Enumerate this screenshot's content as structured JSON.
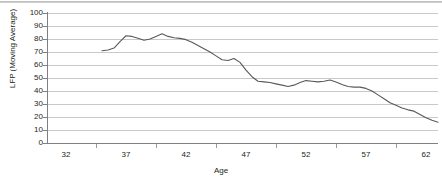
{
  "chart_data": {
    "type": "line",
    "title": "",
    "xlabel": "Age",
    "ylabel": "LFP (Moving Average)",
    "xlim": [
      30.5,
      63.0
    ],
    "ylim": [
      0,
      100
    ],
    "grid": true,
    "legend": false,
    "legend_position": "none",
    "x_tick_labels": [
      "32",
      "37",
      "42",
      "47",
      "52",
      "57",
      "62"
    ],
    "x_tick_values": [
      32,
      37,
      42,
      47,
      52,
      57,
      62
    ],
    "x_minor_tick_values": [
      34.5,
      39.5,
      44.5,
      49.5,
      54.5,
      59.5
    ],
    "y_tick_labels": [
      "0",
      "10",
      "20",
      "30",
      "40",
      "50",
      "60",
      "70",
      "80",
      "90",
      "100"
    ],
    "y_tick_values": [
      0,
      10,
      20,
      30,
      40,
      50,
      60,
      70,
      80,
      90,
      100
    ],
    "line_color": "#595959",
    "grid_color": "#c9c9c9",
    "axis_color": "#808080",
    "series": [
      {
        "name": "LFP (Moving Average)",
        "x": [
          35.0,
          35.5,
          36.0,
          36.5,
          37.0,
          37.5,
          38.0,
          38.5,
          39.0,
          39.5,
          40.0,
          40.5,
          41.0,
          41.5,
          42.0,
          42.5,
          43.0,
          43.5,
          44.0,
          44.5,
          45.0,
          45.5,
          46.0,
          46.5,
          47.0,
          47.5,
          48.0,
          48.5,
          49.0,
          49.5,
          50.0,
          50.5,
          51.0,
          51.5,
          52.0,
          52.5,
          53.0,
          53.5,
          54.0,
          54.5,
          55.0,
          55.5,
          56.0,
          56.5,
          57.0,
          57.5,
          58.0,
          58.5,
          59.0,
          59.5,
          60.0,
          60.5,
          61.0,
          61.5,
          62.0,
          62.5,
          63.0
        ],
        "y": [
          71.0,
          71.5,
          73.0,
          78.0,
          82.5,
          82.0,
          80.5,
          79.0,
          80.0,
          82.0,
          84.0,
          82.0,
          81.0,
          80.5,
          79.5,
          77.5,
          75.0,
          72.5,
          70.0,
          67.0,
          64.0,
          63.5,
          65.0,
          62.0,
          56.0,
          51.0,
          47.5,
          47.0,
          46.5,
          45.5,
          44.5,
          43.5,
          44.5,
          46.5,
          48.0,
          47.5,
          47.0,
          47.5,
          48.5,
          47.0,
          45.0,
          43.5,
          43.0,
          43.0,
          42.0,
          40.0,
          37.0,
          34.0,
          31.0,
          29.0,
          27.0,
          25.5,
          24.5,
          22.0,
          19.5,
          17.5,
          16.0
        ]
      }
    ]
  }
}
